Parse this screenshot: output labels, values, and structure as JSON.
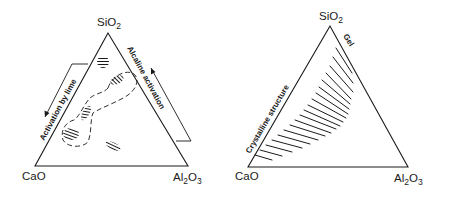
{
  "figure": {
    "left_diagram": {
      "vertices": {
        "top": {
          "formula": "SiO",
          "subscript": "2"
        },
        "bottom_left": {
          "formula": "CaO"
        },
        "bottom_right": {
          "formula": "Al",
          "subscript_mid": "2",
          "formula_end": "O",
          "subscript": "3"
        }
      },
      "annotations": {
        "left_side": "Activation by lime",
        "right_side": "Alcaline activation"
      },
      "hatched_regions": 5,
      "dashed_envelope": true
    },
    "right_diagram": {
      "vertices": {
        "top": {
          "formula": "SiO",
          "subscript": "2"
        },
        "bottom_left": {
          "formula": "CaO"
        },
        "bottom_right": {
          "formula": "Al",
          "subscript_mid": "2",
          "formula_end": "O",
          "subscript": "3"
        }
      },
      "annotations": {
        "left_side": "Crystalline structure",
        "right_side": "Gel"
      }
    },
    "colors": {
      "ink": "#1a1a1a",
      "background": "#ffffff"
    }
  }
}
